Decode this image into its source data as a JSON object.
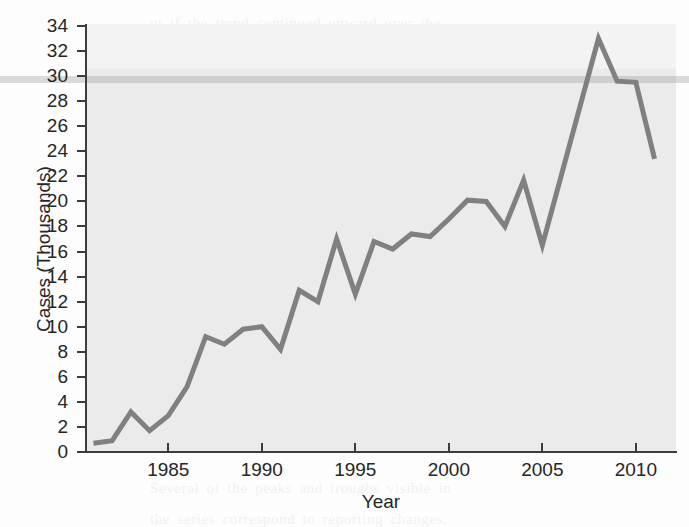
{
  "figure": {
    "axis_title_x": "Year",
    "axis_title_y": "Cases (Thousands)",
    "line_color": "#808080",
    "plot_background": "#ebebeb",
    "axis_color": "#3c3c3c",
    "text_color": "#262626"
  },
  "background_bleed_text": "ut if the trend continued upward over the\nnext years, and the data were recorded in\n\nrates rather than raw counts, then a\nnormalizing adjustment would be needed,\nbecause the population also grew.\n\nThe practical question is whether the\nsample changes shape when the underlying\npopulation base is held constant over the\nwhole interval. In cases where the base\nchanges quickly, the proportions can move\neven when the absolute counts stay flat,\nand equivalently the reverse can happen.\n\nSeveral of the peaks and troughs visible in\nthe series correspond to reporting changes,\nnot to real changes in incidence at all.",
  "chart_data": {
    "type": "line",
    "title": "",
    "xlabel": "Year",
    "ylabel": "Cases (Thousands)",
    "xlim": [
      1980.6,
      2012.2
    ],
    "ylim": [
      0,
      34
    ],
    "yticks": [
      0,
      2,
      4,
      6,
      8,
      10,
      12,
      14,
      16,
      18,
      20,
      22,
      24,
      26,
      28,
      30,
      32,
      34
    ],
    "ytick_labels": [
      "0",
      "2",
      "4",
      "6",
      "8",
      "10",
      "12",
      "14",
      "16",
      "18",
      "20",
      "22",
      "24",
      "26",
      "28",
      "30",
      "32",
      "34"
    ],
    "xticks": [
      1985,
      1990,
      1995,
      2000,
      2005,
      2010
    ],
    "xtick_labels": [
      "1985",
      "1990",
      "1995",
      "2000",
      "2005",
      "2010"
    ],
    "grid": false,
    "legend": false,
    "series_name": "Cases",
    "x": [
      1981,
      1982,
      1983,
      1984,
      1985,
      1986,
      1987,
      1988,
      1989,
      1990,
      1991,
      1992,
      1993,
      1994,
      1995,
      1996,
      1997,
      1998,
      1999,
      2000,
      2001,
      2002,
      2003,
      2004,
      2005,
      2006,
      2007,
      2008,
      2009,
      2010,
      2011
    ],
    "y": [
      0.7,
      0.9,
      3.2,
      1.7,
      2.9,
      5.2,
      9.2,
      8.6,
      9.8,
      10.0,
      8.2,
      12.9,
      12.0,
      17.0,
      12.6,
      16.8,
      16.2,
      17.4,
      17.2,
      18.6,
      20.1,
      20.0,
      18.0,
      21.7,
      16.5,
      22.0,
      27.5,
      33.0,
      29.6,
      29.5,
      23.4
    ]
  }
}
